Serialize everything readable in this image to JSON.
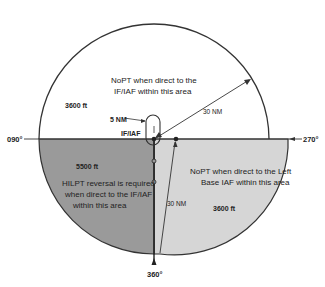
{
  "diagram": {
    "type": "Terminal Arrival Area (TAA) plan view",
    "colors": {
      "background": "#ffffff",
      "straight_in_area": "#ffffff",
      "left_base_area": "#d6d6d6",
      "right_base_area": "#9a9a9a",
      "lines": "#333333"
    },
    "bearings": {
      "left": "090°",
      "right": "270°",
      "bottom": "360°"
    },
    "areas": {
      "straight_in": {
        "altitude": "3600 ft",
        "note_line1": "NoPT when direct to the",
        "note_line2": "IF/IAF within this area",
        "radius_label": "30 NM"
      },
      "hilpt_area": {
        "altitude": "5500 ft",
        "note_line1": "HILPT reversal is required",
        "note_line2": "when direct to the IF/IAF",
        "note_line3": "within this area"
      },
      "left_base": {
        "altitude": "3600 ft",
        "note_line1": "NoPT when direct to the Left",
        "note_line2": "Base IAF within this area",
        "radius_label": "30 NM"
      }
    },
    "fixes": {
      "holding_label": "5 NM",
      "if_iaf_label": "IF/IAF"
    }
  }
}
